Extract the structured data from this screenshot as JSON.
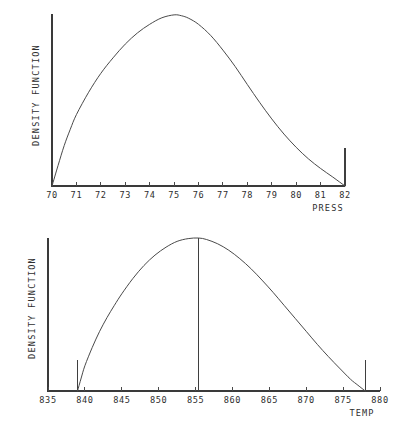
{
  "page": {
    "background_color": "#ffffff",
    "ink_color": "#4a4a4a"
  },
  "chart_data": [
    {
      "id": "press",
      "type": "line",
      "title": "",
      "xlabel": "PRESS",
      "ylabel": "DENSITY FUNCTION",
      "xlim": [
        70,
        82
      ],
      "ylim": [
        0,
        1
      ],
      "grid": false,
      "legend": "none",
      "xticks": [
        70,
        71,
        72,
        73,
        74,
        75,
        76,
        77,
        78,
        79,
        80,
        81,
        82
      ],
      "xtick_labels": [
        "70",
        "71",
        "72",
        "73",
        "74",
        "75",
        "76",
        "77",
        "78",
        "79",
        "80",
        "81",
        "82"
      ],
      "yticks": [],
      "ytick_labels": [],
      "annotations": [
        {
          "name": "right-boundary-rule",
          "x": 82,
          "y0": 0,
          "y1": 0.22
        }
      ],
      "series": [
        {
          "name": "density",
          "x": [
            70.0,
            70.25,
            70.5,
            70.75,
            71.0,
            71.5,
            72.0,
            72.5,
            73.0,
            73.5,
            74.0,
            74.5,
            75.0,
            75.3,
            75.6,
            76.0,
            76.5,
            77.0,
            77.5,
            78.0,
            78.5,
            79.0,
            79.5,
            80.0,
            80.5,
            81.0,
            81.5,
            82.0
          ],
          "y": [
            0.0,
            0.12,
            0.235,
            0.33,
            0.415,
            0.545,
            0.655,
            0.745,
            0.825,
            0.89,
            0.94,
            0.978,
            0.995,
            0.99,
            0.975,
            0.94,
            0.875,
            0.79,
            0.695,
            0.59,
            0.487,
            0.39,
            0.302,
            0.225,
            0.158,
            0.102,
            0.052,
            0.0
          ]
        }
      ]
    },
    {
      "id": "temp",
      "type": "line",
      "title": "",
      "xlabel": "TEMP",
      "ylabel": "DENSITY FUNCTION",
      "xlim": [
        835,
        880
      ],
      "ylim": [
        0,
        1
      ],
      "grid": false,
      "legend": "none",
      "xticks": [
        835,
        840,
        845,
        850,
        855,
        860,
        865,
        870,
        875,
        880
      ],
      "xtick_labels": [
        "835",
        "840",
        "845",
        "850",
        "855",
        "860",
        "865",
        "870",
        "875",
        "880"
      ],
      "yticks": [],
      "ytick_labels": [],
      "annotations": [
        {
          "name": "lower-bound-rule",
          "x": 839,
          "y0": 0,
          "y1": 0.2
        },
        {
          "name": "mode-rule",
          "x": 855.4,
          "y0": 0,
          "y1": 1.0
        },
        {
          "name": "upper-bound-rule",
          "x": 878,
          "y0": 0,
          "y1": 0.2
        }
      ],
      "series": [
        {
          "name": "density",
          "x": [
            839.0,
            839.5,
            840.0,
            841.0,
            842.0,
            843.0,
            844.0,
            845.0,
            846.5,
            848.0,
            849.5,
            851.0,
            852.5,
            854.0,
            855.4,
            856.5,
            858.0,
            859.5,
            861.0,
            862.5,
            864.0,
            865.5,
            867.0,
            868.5,
            870.0,
            871.5,
            873.0,
            874.5,
            876.0,
            877.0,
            878.0
          ],
          "y": [
            0.0,
            0.085,
            0.165,
            0.285,
            0.39,
            0.48,
            0.56,
            0.635,
            0.735,
            0.82,
            0.888,
            0.94,
            0.978,
            0.996,
            1.0,
            0.99,
            0.962,
            0.92,
            0.865,
            0.8,
            0.725,
            0.645,
            0.56,
            0.475,
            0.39,
            0.305,
            0.225,
            0.15,
            0.077,
            0.038,
            0.0
          ]
        }
      ]
    }
  ],
  "charts_meta": {
    "press": {
      "plot_left_px": 52,
      "plot_right_px": 345,
      "baseline_px": 186,
      "axis_top_px": 14,
      "xlabel_x_px": 328,
      "xlabel_y_px": 211,
      "ylabel_x_px": 39,
      "ylabel_y_px": 95,
      "tick_label_y_px": 198,
      "tick_len_px": 4
    },
    "temp": {
      "plot_left_px": 48,
      "plot_right_px": 380,
      "baseline_px": 171,
      "axis_top_px": 18,
      "xlabel_x_px": 362,
      "xlabel_y_px": 196,
      "ylabel_x_px": 35,
      "ylabel_y_px": 88,
      "tick_label_y_px": 183,
      "tick_len_px": 4
    }
  }
}
